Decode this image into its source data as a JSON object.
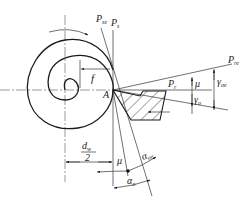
{
  "diagram": {
    "title": "",
    "labels": {
      "Pse": {
        "main": "P",
        "sub": "se"
      },
      "Ps": {
        "main": "P",
        "sub": "s"
      },
      "Pre": {
        "main": "P",
        "sub": "re"
      },
      "Pr": {
        "main": "P",
        "sub": "r"
      },
      "f": "f",
      "A": "A",
      "mu_top": "μ",
      "gamma_oe": {
        "main": "γ",
        "sub": "oe"
      },
      "gamma_o": {
        "main": "γ",
        "sub": "o"
      },
      "dw_num": {
        "main": "d",
        "sub": "w"
      },
      "dw_den": "2",
      "mu_bottom": "μ",
      "alpha_oe": {
        "main": "α",
        "sub": "oe"
      },
      "alpha_o": {
        "main": "α",
        "sub": "o"
      }
    },
    "colors": {
      "line": "#1a1a1a",
      "background": "#ffffff"
    }
  }
}
